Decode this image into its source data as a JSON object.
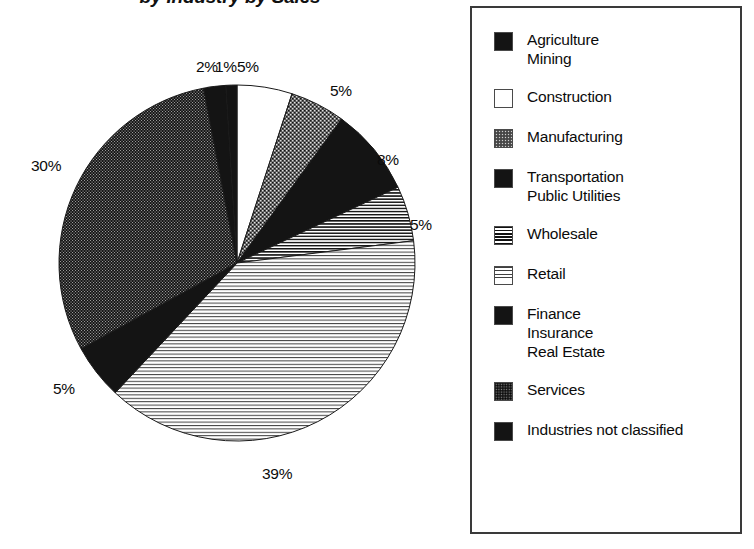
{
  "chart_data": {
    "type": "pie",
    "title": "by Industry by Sales",
    "legend_position": "right",
    "categories": [
      "Agriculture Mining",
      "Construction",
      "Manufacturing",
      "Transportation Public Utilities",
      "Wholesale",
      "Retail",
      "Finance Insurance Real Estate",
      "Services",
      "Industries not classified"
    ],
    "values": [
      2,
      5,
      5,
      8,
      5,
      39,
      5,
      30,
      1
    ],
    "value_labels": [
      "2%",
      "5%",
      "5%",
      "8%",
      "5%",
      "39%",
      "5%",
      "30%",
      "1%"
    ],
    "xlabel": "",
    "ylabel": ""
  },
  "title": "by Industry by Sales",
  "pie": {
    "slices": [
      {
        "name": "construction",
        "label": "5%",
        "value": 5,
        "pattern": "white",
        "label_x": 237,
        "label_y": 58
      },
      {
        "name": "manufacturing",
        "label": "5%",
        "value": 5,
        "pattern": "speckle-mid",
        "label_x": 330,
        "label_y": 82
      },
      {
        "name": "transportation",
        "label": "8%",
        "value": 8,
        "pattern": "solid-black",
        "label_x": 377,
        "label_y": 151
      },
      {
        "name": "wholesale",
        "label": "5%",
        "value": 5,
        "pattern": "hlines-dense",
        "label_x": 410,
        "label_y": 216
      },
      {
        "name": "retail",
        "label": "39%",
        "value": 39,
        "pattern": "hlines-light",
        "label_x": 262,
        "label_y": 465
      },
      {
        "name": "finance",
        "label": "5%",
        "value": 5,
        "pattern": "solid-black",
        "label_x": 53,
        "label_y": 380
      },
      {
        "name": "services",
        "label": "30%",
        "value": 30,
        "pattern": "speckle-dark",
        "label_x": 31,
        "label_y": 157
      },
      {
        "name": "agriculture-mining",
        "label": "2%",
        "value": 2,
        "pattern": "solid-black",
        "label_x": 196,
        "label_y": 58
      },
      {
        "name": "industries-not-classified",
        "label": "1%",
        "value": 1,
        "pattern": "solid-black",
        "label_x": 215,
        "label_y": 58
      }
    ]
  },
  "legend": {
    "items": [
      {
        "key": "agriculture-mining",
        "pattern": "solid-black",
        "lines": [
          "Agriculture",
          "Mining"
        ]
      },
      {
        "key": "construction",
        "pattern": "white",
        "lines": [
          "Construction"
        ]
      },
      {
        "key": "manufacturing",
        "pattern": "speckle-mid",
        "lines": [
          "Manufacturing"
        ]
      },
      {
        "key": "transportation",
        "pattern": "solid-black",
        "lines": [
          "Transportation",
          "Public Utilities"
        ]
      },
      {
        "key": "wholesale",
        "pattern": "hlines-dense",
        "lines": [
          "Wholesale"
        ]
      },
      {
        "key": "retail",
        "pattern": "hlines-light",
        "lines": [
          "Retail"
        ]
      },
      {
        "key": "finance",
        "pattern": "solid-black",
        "lines": [
          "Finance",
          "Insurance",
          "Real Estate"
        ]
      },
      {
        "key": "services",
        "pattern": "speckle-dark",
        "lines": [
          "Services"
        ]
      },
      {
        "key": "industries-not-classified",
        "pattern": "solid-black",
        "lines": [
          "Industries not classified"
        ]
      }
    ]
  }
}
